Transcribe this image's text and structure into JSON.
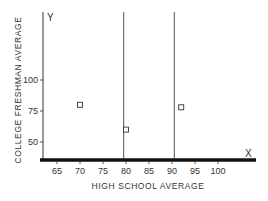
{
  "chart_data": {
    "type": "scatter",
    "title": "",
    "xlabel": "HIGH SCHOOL AVERAGE",
    "ylabel": "COLLEGE FRESHMAN AVERAGE",
    "x_axis_letter": "X",
    "y_axis_letter": "Y",
    "x_ticks": [
      65,
      70,
      75,
      80,
      85,
      90,
      95,
      100
    ],
    "y_ticks": [
      50,
      75,
      100
    ],
    "xlim": [
      61.5,
      108
    ],
    "ylim": [
      36,
      150
    ],
    "grid": false,
    "legend": null,
    "series": [
      {
        "name": "students",
        "marker": "open-square",
        "points": [
          {
            "x": 70,
            "y": 80
          },
          {
            "x": 80,
            "y": 60
          },
          {
            "x": 92,
            "y": 78
          }
        ]
      }
    ],
    "vertical_lines": [
      79.5,
      90.5
    ],
    "colors": {
      "axis": "#111111",
      "line": "#555555",
      "marker": "#333333",
      "text": "#333333"
    }
  }
}
